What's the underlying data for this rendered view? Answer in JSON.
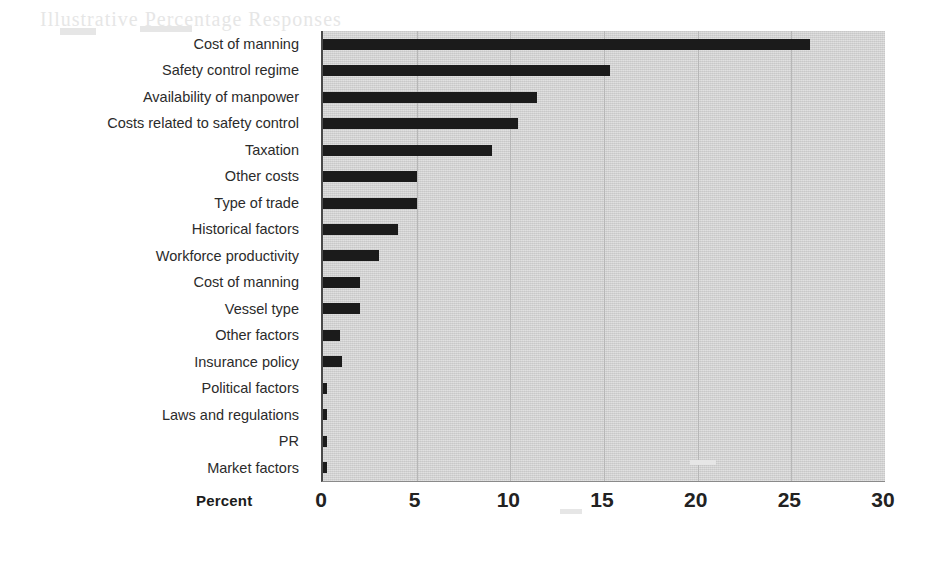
{
  "chart_data": {
    "type": "bar",
    "orientation": "horizontal",
    "title": "",
    "xlabel": "Percent",
    "ylabel": "",
    "xlim": [
      0,
      30
    ],
    "xticks": [
      0,
      5,
      10,
      15,
      20,
      25,
      30
    ],
    "grid": true,
    "legend": "none",
    "bar_color": "#1b1b1b",
    "plot_background": "#d2d2d2",
    "categories": [
      "Cost of manning",
      "Safety control regime",
      "Availability of manpower",
      "Costs related to safety control",
      "Taxation",
      "Other costs",
      "Type of trade",
      "Historical factors",
      "Workforce productivity",
      "Cost of manning",
      "Vessel type",
      "Other factors",
      "Insurance policy",
      "Political factors",
      "Laws and regulations",
      "PR",
      "Market factors"
    ],
    "values": [
      26.0,
      15.3,
      11.4,
      10.4,
      9.0,
      5.0,
      5.0,
      4.0,
      3.0,
      2.0,
      2.0,
      0.9,
      1.0,
      0.2,
      0.2,
      0.2,
      0.2
    ]
  },
  "ghost_text": "Illustrative Percentage Responses",
  "axis": {
    "x_title": "Percent"
  }
}
